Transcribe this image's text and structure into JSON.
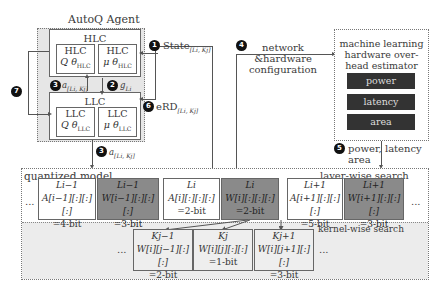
{
  "agent": {
    "title": "AutoQ Agent",
    "hlc": {
      "label": "HLC",
      "q_box": {
        "line1": "HLC",
        "line2": "Q θ_HLC"
      },
      "mu_box": {
        "line1": "HLC",
        "line2": "μ θ_HLC"
      }
    },
    "llc": {
      "label": "LLC",
      "q_box": {
        "line1": "LLC",
        "line2": "Q θ_LLC"
      },
      "mu_box": {
        "line1": "LLC",
        "line2": "μ θ_LLC"
      }
    }
  },
  "steps": [
    {
      "num": "1",
      "label": "State[L_i, K_j]"
    },
    {
      "num": "2",
      "label": "g_{L_i}"
    },
    {
      "num": "3",
      "label": "a[L_i, K_j]"
    },
    {
      "num": "4",
      "label": "network &hardware configuration"
    },
    {
      "num": "5",
      "label": "power, latency area"
    },
    {
      "num": "6",
      "label": "eRD[L_i, K_j]"
    },
    {
      "num": "7",
      "label": ""
    }
  ],
  "step_text": {
    "s1": "State",
    "s1_sub": "[Li, Kj]",
    "s2": "g",
    "s2_sub": "Li",
    "s3": "a",
    "s3_sub": "[Li, Kj]",
    "s4_line1": "network",
    "s4_line2": "&hardware",
    "s4_line3": "configuration",
    "s5_line1": "power, latency",
    "s5_line2": "area",
    "s6": "eRD",
    "s6_sub": "[Li, Kj]"
  },
  "estimator": {
    "title_line1": "machine learning",
    "title_line2": "hardware over-",
    "title_line3": "head estimator",
    "metrics": [
      "power",
      "latency",
      "area"
    ]
  },
  "quantized_model": {
    "title": "quantized model",
    "layer_search_label": "layer-wise search",
    "kernel_search_label": "kernel-wise search",
    "ellipsis": "...",
    "layers": [
      {
        "name": "L_{i-1}",
        "head": "Li−1",
        "body": "A[i−1][:][:][:]",
        "bits": "=4-bit",
        "type": "activation"
      },
      {
        "name": "L_{i-1}",
        "head": "Li−1",
        "body": "W[i−1][:][:][:]",
        "bits": "=3-bit",
        "type": "weight"
      },
      {
        "name": "L_i",
        "head": "Li",
        "body": "A[i][:][:][:]",
        "bits": "=2-bit",
        "type": "activation"
      },
      {
        "name": "L_i",
        "head": "Li",
        "body": "W[i][:][:][:]",
        "bits": "=2-bit",
        "type": "weight"
      },
      {
        "name": "L_{i+1}",
        "head": "Li+1",
        "body": "A[i+1][:][:][:]",
        "bits": "=5-bit",
        "type": "activation"
      },
      {
        "name": "L_{i+1}",
        "head": "Li+1",
        "body": "W[i+1][:][:][:]",
        "bits": "=3-bit",
        "type": "weight"
      }
    ],
    "kernels": [
      {
        "head": "Kj−1",
        "body": "W[i][j−1][:][:]",
        "bits": "=2-bit"
      },
      {
        "head": "Kj",
        "body": "W[i][j][:][:]",
        "bits": "=1-bit"
      },
      {
        "head": "Kj+1",
        "body": "W[i][j+1][:][:]",
        "bits": "=3-bit"
      }
    ]
  },
  "colors": {
    "weight_fill": "#8a8a8a",
    "estimator_bar": "#333333",
    "agent_bg": "#e6e6e6",
    "kernel_bg": "#eeeeee"
  }
}
